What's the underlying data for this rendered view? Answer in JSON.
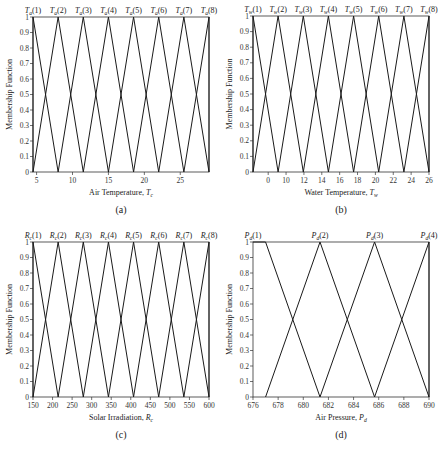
{
  "chart_data": [
    {
      "id": "a",
      "type": "line",
      "panel_label": "(a)",
      "title": "",
      "xlabel": "Air Temperature, T",
      "xlabel_sub": "c",
      "ylabel": "Membership Function",
      "xlim": [
        4.5,
        29
      ],
      "ylim": [
        0,
        1
      ],
      "xticks": [
        5,
        10,
        15,
        20,
        25
      ],
      "xtick_labels": [
        "5",
        "10",
        "15",
        "20",
        "25"
      ],
      "yticks": [
        0,
        0.1,
        0.2,
        0.3,
        0.4,
        0.5,
        0.6,
        0.7,
        0.8,
        0.9,
        1
      ],
      "ytick_labels": [
        "0",
        "0.1",
        "0.2",
        "0.3",
        "0.4",
        "0.5",
        "0.6",
        "0.7",
        "0.8",
        "0.9",
        "1"
      ],
      "set_prefix": "T",
      "set_sub": "a",
      "set_labels": [
        "(1)",
        "(2)",
        "(3)",
        "(4)",
        "(5)",
        "(6)",
        "(7)",
        "(8)"
      ],
      "series": [
        {
          "name": "Ta(1)",
          "x": [
            4.5,
            4.5,
            8
          ],
          "y": [
            0,
            1,
            0
          ]
        },
        {
          "name": "Ta(2)",
          "x": [
            4.5,
            8,
            11.5
          ],
          "y": [
            0,
            1,
            0
          ]
        },
        {
          "name": "Ta(3)",
          "x": [
            8,
            11.5,
            15
          ],
          "y": [
            0,
            1,
            0
          ]
        },
        {
          "name": "Ta(4)",
          "x": [
            11.5,
            15,
            18.5
          ],
          "y": [
            0,
            1,
            0
          ]
        },
        {
          "name": "Ta(5)",
          "x": [
            15,
            18.5,
            22
          ],
          "y": [
            0,
            1,
            0
          ]
        },
        {
          "name": "Ta(6)",
          "x": [
            18.5,
            22,
            25.5
          ],
          "y": [
            0,
            1,
            0
          ]
        },
        {
          "name": "Ta(7)",
          "x": [
            22,
            25.5,
            29
          ],
          "y": [
            0,
            1,
            0
          ]
        },
        {
          "name": "Ta(8)",
          "x": [
            25.5,
            29,
            29
          ],
          "y": [
            0,
            1,
            0
          ]
        }
      ],
      "box": {
        "x": 33,
        "y": 17,
        "w": 176,
        "h": 155
      },
      "grid": false,
      "legend": "labels above peaks"
    },
    {
      "id": "b",
      "type": "line",
      "panel_label": "(b)",
      "title": "",
      "xlabel": "Water Temperature, T",
      "xlabel_sub": "w",
      "ylabel": "Membership Function",
      "xlim": [
        6.3,
        26
      ],
      "ylim": [
        0,
        1
      ],
      "xticks": [
        8,
        10,
        12,
        14,
        16,
        18,
        20,
        22,
        24,
        26
      ],
      "xtick_labels": [
        "0",
        "10",
        "12",
        "14",
        "16",
        "18",
        "20",
        "22",
        "24",
        "26"
      ],
      "yticks": [
        0,
        0.1,
        0.2,
        0.3,
        0.4,
        0.5,
        0.6,
        0.7,
        0.8,
        0.9,
        1
      ],
      "ytick_labels": [
        "0",
        "0.1",
        "0.2",
        "0.3",
        "0.4",
        "0.5",
        "0.6",
        "0.7",
        "0.8",
        "0.9",
        "1"
      ],
      "set_prefix": "T",
      "set_sub": "w",
      "set_labels": [
        "(1)",
        "(2)",
        "(3)",
        "(4)",
        "(5)",
        "(6)",
        "(7)",
        "(8)"
      ],
      "series": [
        {
          "name": "Tw(1)",
          "x": [
            6.3,
            6.3,
            9.11
          ],
          "y": [
            0,
            1,
            0
          ]
        },
        {
          "name": "Tw(2)",
          "x": [
            6.3,
            9.11,
            11.93
          ],
          "y": [
            0,
            1,
            0
          ]
        },
        {
          "name": "Tw(3)",
          "x": [
            9.11,
            11.93,
            14.74
          ],
          "y": [
            0,
            1,
            0
          ]
        },
        {
          "name": "Tw(4)",
          "x": [
            11.93,
            14.74,
            17.56
          ],
          "y": [
            0,
            1,
            0
          ]
        },
        {
          "name": "Tw(5)",
          "x": [
            14.74,
            17.56,
            20.37
          ],
          "y": [
            0,
            1,
            0
          ]
        },
        {
          "name": "Tw(6)",
          "x": [
            17.56,
            20.37,
            23.19
          ],
          "y": [
            0,
            1,
            0
          ]
        },
        {
          "name": "Tw(7)",
          "x": [
            20.37,
            23.19,
            26
          ],
          "y": [
            0,
            1,
            0
          ]
        },
        {
          "name": "Tw(8)",
          "x": [
            23.19,
            26,
            26
          ],
          "y": [
            0,
            1,
            0
          ]
        }
      ],
      "box": {
        "x": 253,
        "y": 16,
        "w": 176,
        "h": 156
      },
      "grid": false,
      "legend": "labels above peaks"
    },
    {
      "id": "c",
      "type": "line",
      "panel_label": "(c)",
      "title": "",
      "xlabel": "Solar Irradiation, R",
      "xlabel_sub": "c",
      "ylabel": "Membership Function",
      "xlim": [
        150,
        600
      ],
      "ylim": [
        0,
        1
      ],
      "xticks": [
        150,
        200,
        250,
        300,
        350,
        400,
        450,
        500,
        550,
        600
      ],
      "xtick_labels": [
        "150",
        "200",
        "250",
        "300",
        "350",
        "400",
        "450",
        "500",
        "550",
        "600"
      ],
      "yticks": [
        0,
        0.1,
        0.2,
        0.3,
        0.4,
        0.5,
        0.6,
        0.7,
        0.8,
        0.9,
        1
      ],
      "ytick_labels": [
        "0",
        "0.1",
        "0.2",
        "0.3",
        "0.4",
        "0.5",
        "0.6",
        "0.7",
        "0.8",
        "0.9",
        "1"
      ],
      "set_prefix": "R",
      "set_sub": "c",
      "set_labels": [
        "(1)",
        "(2)",
        "(3)",
        "(4)",
        "(5)",
        "(6)",
        "(7)",
        "(8)"
      ],
      "series": [
        {
          "name": "Rc(1)",
          "x": [
            150,
            150,
            214.3
          ],
          "y": [
            0,
            1,
            0
          ]
        },
        {
          "name": "Rc(2)",
          "x": [
            150,
            214.3,
            278.6
          ],
          "y": [
            0,
            1,
            0
          ]
        },
        {
          "name": "Rc(3)",
          "x": [
            214.3,
            278.6,
            342.9
          ],
          "y": [
            0,
            1,
            0
          ]
        },
        {
          "name": "Rc(4)",
          "x": [
            278.6,
            342.9,
            407.1
          ],
          "y": [
            0,
            1,
            0
          ]
        },
        {
          "name": "Rc(5)",
          "x": [
            342.9,
            407.1,
            471.4
          ],
          "y": [
            0,
            1,
            0
          ]
        },
        {
          "name": "Rc(6)",
          "x": [
            407.1,
            471.4,
            535.7
          ],
          "y": [
            0,
            1,
            0
          ]
        },
        {
          "name": "Rc(7)",
          "x": [
            471.4,
            535.7,
            600
          ],
          "y": [
            0,
            1,
            0
          ]
        },
        {
          "name": "Rc(8)",
          "x": [
            535.7,
            600,
            600
          ],
          "y": [
            0,
            1,
            0
          ]
        }
      ],
      "box": {
        "x": 33,
        "y": 242,
        "w": 176,
        "h": 155
      },
      "grid": false,
      "legend": "labels above peaks"
    },
    {
      "id": "d",
      "type": "line",
      "panel_label": "(d)",
      "title": "",
      "xlabel": "Air Pressure, P",
      "xlabel_sub": "d",
      "ylabel": "Membership Function",
      "xlim": [
        676,
        690
      ],
      "ylim": [
        0,
        1
      ],
      "xticks": [
        676,
        678,
        680,
        682,
        684,
        686,
        688,
        690
      ],
      "xtick_labels": [
        "676",
        "678",
        "680",
        "682",
        "684",
        "686",
        "688",
        "690"
      ],
      "yticks": [
        0,
        0.1,
        0.2,
        0.3,
        0.4,
        0.5,
        0.6,
        0.7,
        0.8,
        0.9,
        1
      ],
      "ytick_labels": [
        "0",
        "0.1",
        "0.2",
        "0.3",
        "0.4",
        "0.5",
        "0.6",
        "0.7",
        "0.8",
        "0.9",
        "1"
      ],
      "set_prefix": "P",
      "set_sub": "d",
      "set_labels": [
        "(1)",
        "(2)",
        "(3)",
        "(4)"
      ],
      "set_label_x": [
        676,
        681.33,
        685.67,
        690
      ],
      "series": [
        {
          "name": "Pd(1)",
          "x": [
            676,
            677,
            681.33
          ],
          "y": [
            1,
            1,
            0
          ]
        },
        {
          "name": "Pd(2)",
          "x": [
            677,
            681.33,
            685.67
          ],
          "y": [
            0,
            1,
            0
          ]
        },
        {
          "name": "Pd(3)",
          "x": [
            681.33,
            685.67,
            690
          ],
          "y": [
            0,
            1,
            0
          ]
        },
        {
          "name": "Pd(4)",
          "x": [
            685.67,
            690,
            690
          ],
          "y": [
            0,
            1,
            0
          ]
        }
      ],
      "box": {
        "x": 253,
        "y": 242,
        "w": 176,
        "h": 155
      },
      "grid": false,
      "legend": "labels above peaks"
    }
  ]
}
